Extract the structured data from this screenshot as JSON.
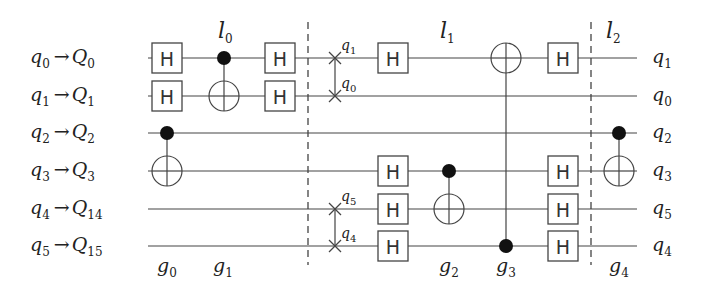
{
  "diagram": {
    "type": "quantum-circuit",
    "input_mapping": [
      {
        "logical": "q",
        "logical_index": "0",
        "physical": "Q",
        "physical_index": "0"
      },
      {
        "logical": "q",
        "logical_index": "1",
        "physical": "Q",
        "physical_index": "1"
      },
      {
        "logical": "q",
        "logical_index": "2",
        "physical": "Q",
        "physical_index": "2"
      },
      {
        "logical": "q",
        "logical_index": "3",
        "physical": "Q",
        "physical_index": "3"
      },
      {
        "logical": "q",
        "logical_index": "4",
        "physical": "Q",
        "physical_index": "14"
      },
      {
        "logical": "q",
        "logical_index": "5",
        "physical": "Q",
        "physical_index": "15"
      }
    ],
    "output_labels": [
      {
        "name": "q",
        "index": "1"
      },
      {
        "name": "q",
        "index": "0"
      },
      {
        "name": "q",
        "index": "2"
      },
      {
        "name": "q",
        "index": "3"
      },
      {
        "name": "q",
        "index": "5"
      },
      {
        "name": "q",
        "index": "4"
      }
    ],
    "layer_labels": [
      {
        "name": "l",
        "index": "0"
      },
      {
        "name": "l",
        "index": "1"
      },
      {
        "name": "l",
        "index": "2"
      }
    ],
    "gate_labels": [
      {
        "name": "g",
        "index": "0"
      },
      {
        "name": "g",
        "index": "1"
      },
      {
        "name": "g",
        "index": "2"
      },
      {
        "name": "g",
        "index": "3"
      },
      {
        "name": "g",
        "index": "4"
      }
    ],
    "swap_labels": [
      {
        "name": "q",
        "index": "1"
      },
      {
        "name": "q",
        "index": "0"
      },
      {
        "name": "q",
        "index": "5"
      },
      {
        "name": "q",
        "index": "4"
      }
    ],
    "hadamard_label": "H",
    "arrow": "→",
    "gates": [
      {
        "type": "H",
        "wire": 0,
        "column": "pre-l0"
      },
      {
        "type": "H",
        "wire": 1,
        "column": "pre-l0"
      },
      {
        "type": "CNOT",
        "control": 2,
        "target": 3,
        "label": "g0"
      },
      {
        "type": "CNOT",
        "control": 0,
        "target": 1,
        "label": "g1",
        "layer": "l0"
      },
      {
        "type": "H",
        "wire": 0,
        "column": "post-l0"
      },
      {
        "type": "H",
        "wire": 1,
        "column": "post-l0"
      },
      {
        "type": "SWAP",
        "wires": [
          0,
          1
        ]
      },
      {
        "type": "SWAP",
        "wires": [
          4,
          5
        ]
      },
      {
        "type": "H",
        "wire": 0
      },
      {
        "type": "H",
        "wire": 3
      },
      {
        "type": "H",
        "wire": 4
      },
      {
        "type": "H",
        "wire": 5
      },
      {
        "type": "CNOT",
        "control": 3,
        "target": 4,
        "label": "g2"
      },
      {
        "type": "CNOT",
        "control": 5,
        "target": 0,
        "label": "g3"
      },
      {
        "type": "H",
        "wire": 0
      },
      {
        "type": "H",
        "wire": 3
      },
      {
        "type": "H",
        "wire": 4
      },
      {
        "type": "H",
        "wire": 5
      },
      {
        "type": "CNOT",
        "control": 2,
        "target": 3,
        "label": "g4",
        "layer": "l2"
      }
    ]
  }
}
